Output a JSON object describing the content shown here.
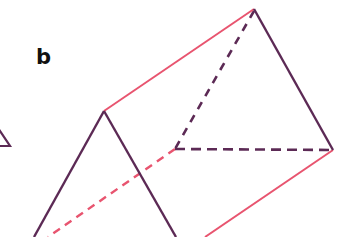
{
  "figure": {
    "label": "b",
    "colors": {
      "triangle_edges": "#5c2a55",
      "length_edges": "#e8546f",
      "background": "#ffffff",
      "label": "#111111"
    },
    "edges": [
      {
        "name": "front-left-edge",
        "style": "solid",
        "color_key": "triangle_edges"
      },
      {
        "name": "front-right-edge",
        "style": "solid",
        "color_key": "triangle_edges"
      },
      {
        "name": "top-length-edge",
        "style": "solid",
        "color_key": "length_edges"
      },
      {
        "name": "back-right-edge",
        "style": "solid",
        "color_key": "triangle_edges"
      },
      {
        "name": "back-left-hidden-edge",
        "style": "dashed",
        "color_key": "triangle_edges"
      },
      {
        "name": "back-base-hidden-edge",
        "style": "dashed",
        "color_key": "triangle_edges"
      },
      {
        "name": "bottom-left-hidden-length-edge",
        "style": "dashed",
        "color_key": "length_edges"
      },
      {
        "name": "bottom-right-length-edge",
        "style": "solid",
        "color_key": "length_edges"
      },
      {
        "name": "partial-shape-left",
        "style": "solid",
        "color_key": "triangle_edges"
      }
    ]
  }
}
